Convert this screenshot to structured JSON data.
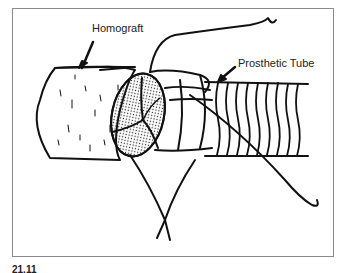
{
  "figure": {
    "labels": {
      "homograft": "Homograft",
      "prosthetic_tube": "Prosthetic Tube"
    },
    "caption": {
      "number": "21.11",
      "text": "(caption truncated at image edge)"
    }
  }
}
